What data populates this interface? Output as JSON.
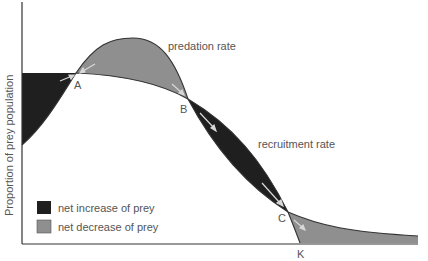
{
  "figure": {
    "type": "diagram",
    "y_axis_label": "Proportion of prey population",
    "curves": [
      {
        "name": "predation rate",
        "label": "predation rate"
      },
      {
        "name": "recruitment rate",
        "label": "recruitment rate"
      }
    ],
    "points": [
      {
        "id": "A",
        "label": "A"
      },
      {
        "id": "B",
        "label": "B"
      },
      {
        "id": "C",
        "label": "C"
      },
      {
        "id": "K",
        "label": "K"
      }
    ],
    "legend": [
      {
        "label": "net increase of prey",
        "color": "#1f1f1f"
      },
      {
        "label": "net decrease of prey",
        "color": "#8f8f8f"
      }
    ],
    "colors": {
      "increase": "#1f1f1f",
      "decrease": "#8f8f8f",
      "axis": "#333333",
      "text": "#555555",
      "arrow": "#d8d8d8"
    }
  }
}
